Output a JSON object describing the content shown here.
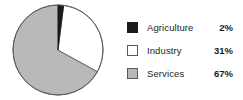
{
  "chart_data": {
    "type": "pie",
    "title": "",
    "categories": [
      "Agriculture",
      "Industry",
      "Services"
    ],
    "values": [
      2,
      31,
      67
    ],
    "value_labels": [
      "2%",
      "31%",
      "67%"
    ],
    "unit": "%",
    "start_angle_deg": 0,
    "direction": "clockwise",
    "legend_position": "right",
    "grid": false,
    "colors": {
      "agriculture": "#1a1a1a",
      "industry": "#ffffff",
      "services": "#b9b9b9",
      "outline": "#5a5a5a",
      "background": "#ffffff",
      "text": "#1c1c1c"
    },
    "slices": [
      {
        "label": "Agriculture",
        "value": 2,
        "value_label": "2%",
        "color": "#1a1a1a",
        "swatch": "black-swatch"
      },
      {
        "label": "Industry",
        "value": 31,
        "value_label": "31%",
        "color": "#ffffff",
        "swatch": "white-swatch"
      },
      {
        "label": "Services",
        "value": 67,
        "value_label": "67%",
        "color": "#b9b9b9",
        "swatch": "gray-swatch"
      }
    ]
  },
  "legend": {
    "rows": [
      {
        "label": "Agriculture",
        "value": "2%"
      },
      {
        "label": "Industry",
        "value": "31%"
      },
      {
        "label": "Services",
        "value": "67%"
      }
    ]
  }
}
